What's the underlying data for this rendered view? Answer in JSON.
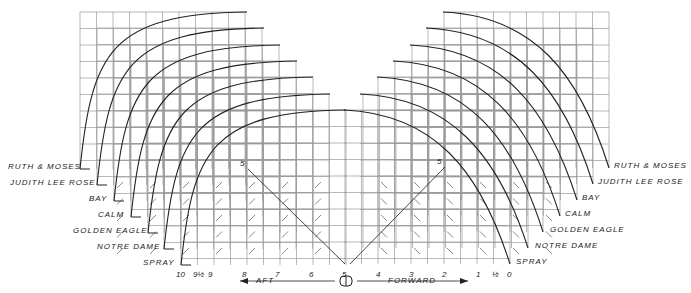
{
  "diagram": {
    "title": "",
    "grid_cell": 16.5,
    "boats": [
      {
        "name": "RUTH & MOSES",
        "left": {
          "x0": 80,
          "base": 169,
          "top": 12,
          "right": 247
        },
        "right": {
          "x1": 609,
          "base": 168,
          "top": 12,
          "left": 443
        },
        "label_left": {
          "x": 8,
          "y": 162
        },
        "label_right": {
          "x": 614,
          "y": 161
        }
      },
      {
        "name": "JUDITH LEE ROSE",
        "left": {
          "x0": 97,
          "base": 185,
          "top": 28,
          "right": 264
        },
        "right": {
          "x1": 593,
          "base": 184,
          "top": 28,
          "left": 426
        },
        "label_left": {
          "x": 10,
          "y": 178
        },
        "label_right": {
          "x": 598,
          "y": 177
        }
      },
      {
        "name": "BAY",
        "left": {
          "x0": 114,
          "base": 201,
          "top": 45,
          "right": 280
        },
        "right": {
          "x1": 577,
          "base": 200,
          "top": 45,
          "left": 410
        },
        "label_left": {
          "x": 89,
          "y": 194
        },
        "label_right": {
          "x": 582,
          "y": 193
        }
      },
      {
        "name": "CALM",
        "left": {
          "x0": 131,
          "base": 217,
          "top": 61,
          "right": 297
        },
        "right": {
          "x1": 560,
          "base": 216,
          "top": 61,
          "left": 393
        },
        "label_left": {
          "x": 98,
          "y": 210
        },
        "label_right": {
          "x": 565,
          "y": 209
        }
      },
      {
        "name": "GOLDEN EAGLE",
        "left": {
          "x0": 148,
          "base": 233,
          "top": 77,
          "right": 313
        },
        "right": {
          "x1": 543,
          "base": 232,
          "top": 77,
          "left": 377
        },
        "label_left": {
          "x": 73,
          "y": 226
        },
        "label_right": {
          "x": 550,
          "y": 225
        }
      },
      {
        "name": "NOTRE DAME",
        "left": {
          "x0": 164,
          "base": 249,
          "top": 94,
          "right": 330
        },
        "right": {
          "x1": 528,
          "base": 248,
          "top": 94,
          "left": 360
        },
        "label_left": {
          "x": 97,
          "y": 242
        },
        "label_right": {
          "x": 535,
          "y": 241
        }
      },
      {
        "name": "SPRAY",
        "left": {
          "x0": 181,
          "base": 265,
          "top": 110,
          "right": 346
        },
        "right": {
          "x1": 510,
          "base": 264,
          "top": 110,
          "left": 344
        },
        "label_left": {
          "x": 143,
          "y": 258
        },
        "label_right": {
          "x": 516,
          "y": 257
        }
      }
    ],
    "stations": [
      {
        "label": "10",
        "x": 179
      },
      {
        "label": "9½",
        "x": 196
      },
      {
        "label": "9",
        "x": 211
      },
      {
        "label": "8",
        "x": 245
      },
      {
        "label": "7",
        "x": 278
      },
      {
        "label": "6",
        "x": 312
      },
      {
        "label": "5",
        "x": 345
      },
      {
        "label": "4",
        "x": 379
      },
      {
        "label": "3",
        "x": 412
      },
      {
        "label": "2",
        "x": 445
      },
      {
        "label": "1",
        "x": 479
      },
      {
        "label": "½",
        "x": 495
      },
      {
        "label": "0",
        "x": 510
      }
    ],
    "station_label_y": 270,
    "diagonals": [
      {
        "label": "5",
        "x1": 248,
        "y1": 169,
        "x2": 345,
        "y2": 264
      },
      {
        "label": "5",
        "x1": 445,
        "y1": 167,
        "x2": 350,
        "y2": 264
      }
    ],
    "direction": {
      "aft_label": "AFT",
      "forward_label": "FORWARD",
      "y": 281,
      "aft_arrow_x1": 240,
      "aft_arrow_x2": 335,
      "forward_arrow_x1": 357,
      "forward_arrow_x2": 468,
      "midship_symbol_x": 346
    },
    "colors": {
      "grid": "#9a9a9a",
      "curve": "#222222",
      "text": "#222222",
      "background": "#ffffff"
    }
  }
}
